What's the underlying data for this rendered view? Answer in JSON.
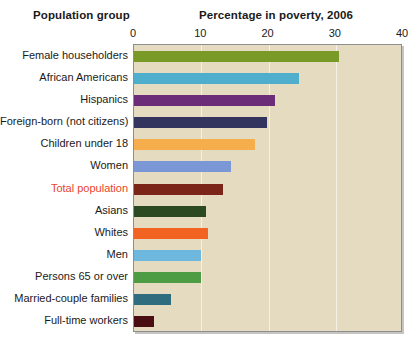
{
  "headers": {
    "group_header": "Population group",
    "value_header": "Percentage in poverty, 2006"
  },
  "colors": {
    "plot_background": "#e4dbc1",
    "plot_border": "#8e8e8e",
    "gridline": "#ffffff",
    "page_background": "#ffffff",
    "text": "#1a1a1a",
    "highlight_text": "#e8452b"
  },
  "chart_data": {
    "type": "bar",
    "orientation": "horizontal",
    "title": "Percentage in poverty, 2006",
    "xlabel": "Percentage in poverty, 2006",
    "ylabel": "Population group",
    "xlim": [
      0,
      40
    ],
    "xticks": [
      0,
      10,
      20,
      30,
      40
    ],
    "grid": true,
    "legend": "none",
    "categories": [
      "Female householders",
      "African Americans",
      "Hispanics",
      "Foreign-born (not citizens)",
      "Children under 18",
      "Women",
      "Total population",
      "Asians",
      "Whites",
      "Men",
      "Persons 65 or over",
      "Married-couple families",
      "Full-time workers"
    ],
    "values": [
      30.5,
      24.5,
      21.0,
      19.8,
      18.0,
      14.4,
      13.3,
      10.7,
      11.0,
      10.0,
      10.0,
      5.5,
      3.0
    ],
    "bar_colors": [
      "#7a9a28",
      "#4faecb",
      "#6b2d77",
      "#33355e",
      "#f5ae4b",
      "#7b97d6",
      "#7b2418",
      "#2c4a22",
      "#f26322",
      "#6eb8e0",
      "#4d9b43",
      "#2e6c7e",
      "#4a0e12"
    ],
    "highlight_category": "Total population"
  }
}
